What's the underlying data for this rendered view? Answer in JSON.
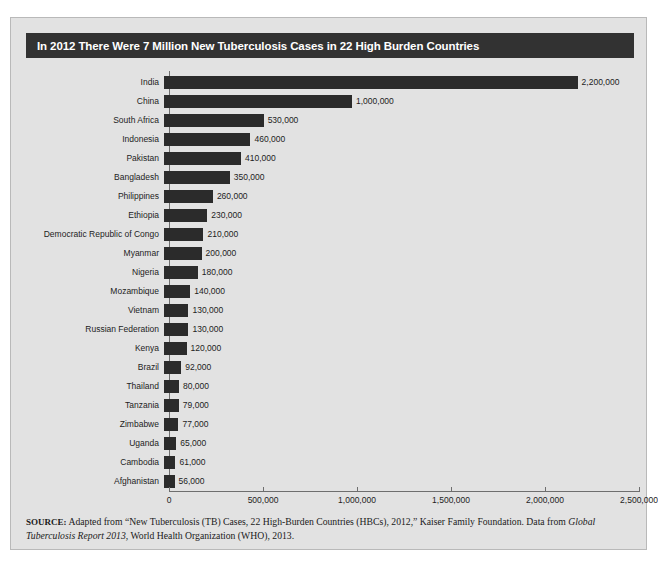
{
  "figure": {
    "title": "In 2012 There Were 7 Million New Tuberculosis Cases in 22 High Burden Countries",
    "title_bar_color": "#323232",
    "panel_color": "#e2e2e2",
    "bar_color": "#2b2b2b"
  },
  "source": {
    "label": "SOURCE:",
    "line1": " Adapted from “New Tuberculosis (TB) Cases, 22 High-Burden Countries (HBCs), 2012,” Kaiser Family Foundation. Data from ",
    "italic": "Global Tuberculosis Report 2013",
    "line2": ", World Health Organization (WHO), 2013."
  },
  "chart_data": {
    "type": "bar",
    "orientation": "horizontal",
    "title": "In 2012 There Were 7 Million New Tuberculosis Cases in 22 High Burden Countries",
    "xlabel": "",
    "ylabel": "",
    "xlim": [
      0,
      2500000
    ],
    "grid": false,
    "legend": false,
    "xticks": [
      0,
      500000,
      1000000,
      1500000,
      2000000,
      2500000
    ],
    "xtick_labels": [
      "0",
      "500,000",
      "1,000,000",
      "1,500,000",
      "2,000,000",
      "2,500,000"
    ],
    "categories": [
      "India",
      "China",
      "South Africa",
      "Indonesia",
      "Pakistan",
      "Bangladesh",
      "Philippines",
      "Ethiopia",
      "Democratic Republic of Congo",
      "Myanmar",
      "Nigeria",
      "Mozambique",
      "Vietnam",
      "Russian Federation",
      "Kenya",
      "Brazil",
      "Thailand",
      "Tanzania",
      "Zimbabwe",
      "Uganda",
      "Cambodia",
      "Afghanistan"
    ],
    "values": [
      2200000,
      1000000,
      530000,
      460000,
      410000,
      350000,
      260000,
      230000,
      210000,
      200000,
      180000,
      140000,
      130000,
      130000,
      120000,
      92000,
      80000,
      79000,
      77000,
      65000,
      61000,
      56000
    ],
    "value_labels": [
      "2,200,000",
      "1,000,000",
      "530,000",
      "460,000",
      "410,000",
      "350,000",
      "260,000",
      "230,000",
      "210,000",
      "200,000",
      "180,000",
      "140,000",
      "130,000",
      "130,000",
      "120,000",
      "92,000",
      "80,000",
      "79,000",
      "77,000",
      "65,000",
      "61,000",
      "56,000"
    ]
  }
}
